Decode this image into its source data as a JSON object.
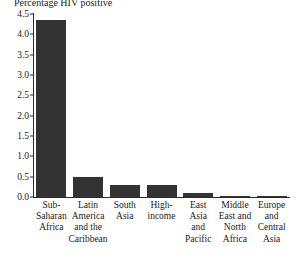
{
  "chart_data": {
    "type": "bar",
    "title": "Percentage HIV positive",
    "xlabel": "",
    "ylabel": "",
    "ylim": [
      0.0,
      4.5
    ],
    "ytick_labels": [
      "0.0",
      "0.5",
      "1.0",
      "1.5",
      "2.0",
      "2.5",
      "3.0",
      "3.5",
      "4.0",
      "4.5"
    ],
    "ytick_values": [
      0.0,
      0.5,
      1.0,
      1.5,
      2.0,
      2.5,
      3.0,
      3.5,
      4.0,
      4.5
    ],
    "grid": false,
    "legend": false,
    "bar_color": "#333333",
    "axis_color": "#2b2b2b",
    "categories": [
      "Sub-\nSaharan\nAfrica",
      "Latin\nAmerica\nand the\nCaribbean",
      "South\nAsia",
      "High-\nincome",
      "East\nAsia\nand\nPacific",
      "Middle\nEast and\nNorth\nAfrica",
      "Europe\nand\nCentral\nAsia"
    ],
    "category_lines": [
      [
        "Sub-",
        "Saharan",
        "Africa"
      ],
      [
        "Latin",
        "America",
        "and the",
        "Caribbean"
      ],
      [
        "South",
        "Asia"
      ],
      [
        "High-",
        "income"
      ],
      [
        "East",
        "Asia",
        "and",
        "Pacific"
      ],
      [
        "Middle",
        "East and",
        "North",
        "Africa"
      ],
      [
        "Europe",
        "and",
        "Central",
        "Asia"
      ]
    ],
    "values": [
      4.35,
      0.5,
      0.3,
      0.3,
      0.1,
      0.02,
      0.02
    ]
  }
}
